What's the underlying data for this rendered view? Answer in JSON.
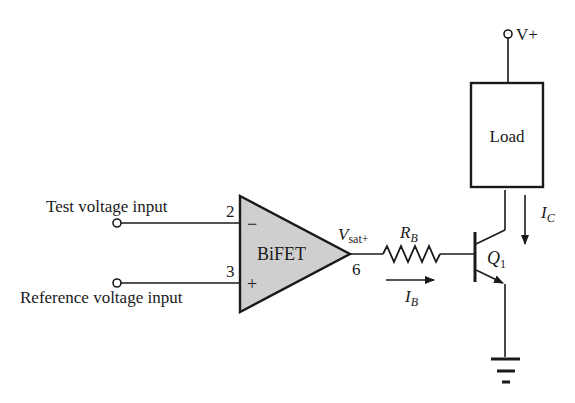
{
  "diagram": {
    "type": "circuit-schematic",
    "colors": {
      "ink": "#1a1a1a",
      "opamp_fill": "#cfcfcf",
      "background": "#ffffff"
    },
    "inputs": {
      "test": {
        "label": "Test voltage input",
        "pin": "2",
        "polarity": "−"
      },
      "reference": {
        "label": "Reference voltage input",
        "pin": "3",
        "polarity": "+"
      }
    },
    "opamp": {
      "label": "BiFET",
      "output_pin": "6",
      "output_label": "V",
      "output_sub": "sat+"
    },
    "resistor": {
      "label": "R",
      "sub": "B"
    },
    "base_current": {
      "label": "I",
      "sub": "B"
    },
    "supply": {
      "label": "V+"
    },
    "load": {
      "label": "Load"
    },
    "collector_current": {
      "label": "I",
      "sub": "C"
    },
    "transistor": {
      "label": "Q",
      "sub": "1"
    }
  }
}
